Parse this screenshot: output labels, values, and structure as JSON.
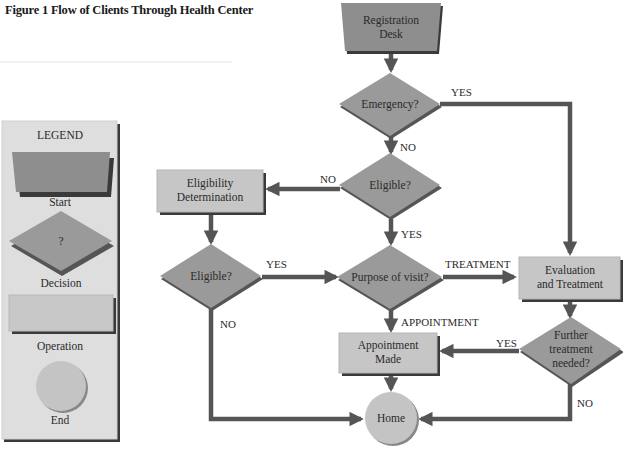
{
  "title": "Figure 1 Flow of Clients Through Health Center",
  "legend": {
    "heading": "LEGEND",
    "items": [
      {
        "shape": "trapezoid",
        "label": "Start"
      },
      {
        "shape": "diamond",
        "symbol": "?",
        "label": "Decision"
      },
      {
        "shape": "rectangle",
        "label": "Operation"
      },
      {
        "shape": "circle",
        "label": "End"
      }
    ]
  },
  "nodes": {
    "registration": {
      "type": "start",
      "line1": "Registration",
      "line2": "Desk"
    },
    "emergency": {
      "type": "decision",
      "line1": "Emergency?"
    },
    "eligible_center": {
      "type": "decision",
      "line1": "Eligible?"
    },
    "eligibility_determination": {
      "type": "operation",
      "line1": "Eligibility",
      "line2": "Determination"
    },
    "eligible_left": {
      "type": "decision",
      "line1": "Eligible?"
    },
    "purpose": {
      "type": "decision",
      "line1": "Purpose of visit?"
    },
    "evaluation": {
      "type": "operation",
      "line1": "Evaluation",
      "line2": "and Treatment"
    },
    "appointment": {
      "type": "operation",
      "line1": "Appointment",
      "line2": "Made"
    },
    "further": {
      "type": "decision",
      "line1": "Further",
      "line2": "treatment",
      "line3": "needed?"
    },
    "home": {
      "type": "end",
      "line1": "Home"
    }
  },
  "edges": [
    {
      "from": "registration",
      "to": "emergency",
      "label": ""
    },
    {
      "from": "emergency",
      "to": "evaluation",
      "label": "YES"
    },
    {
      "from": "emergency",
      "to": "eligible_center",
      "label": "NO"
    },
    {
      "from": "eligible_center",
      "to": "eligibility_determination",
      "label": "NO"
    },
    {
      "from": "eligible_center",
      "to": "purpose",
      "label": "YES"
    },
    {
      "from": "eligibility_determination",
      "to": "eligible_left",
      "label": ""
    },
    {
      "from": "eligible_left",
      "to": "purpose",
      "label": "YES"
    },
    {
      "from": "eligible_left",
      "to": "home",
      "label": "NO"
    },
    {
      "from": "purpose",
      "to": "evaluation",
      "label": "TREATMENT"
    },
    {
      "from": "purpose",
      "to": "appointment",
      "label": "APPOINTMENT"
    },
    {
      "from": "evaluation",
      "to": "further",
      "label": ""
    },
    {
      "from": "further",
      "to": "appointment",
      "label": "YES"
    },
    {
      "from": "further",
      "to": "home",
      "label": "NO"
    },
    {
      "from": "appointment",
      "to": "home",
      "label": ""
    }
  ],
  "colors": {
    "start_fill": "#8e8e8e",
    "decision_fill": "#9a9a9a",
    "operation_fill": "#c6c6c6",
    "end_fill": "#c4c4c4",
    "legend_bg": "#dedede",
    "arrow": "#555555",
    "shadow": "#3a3a3a"
  }
}
